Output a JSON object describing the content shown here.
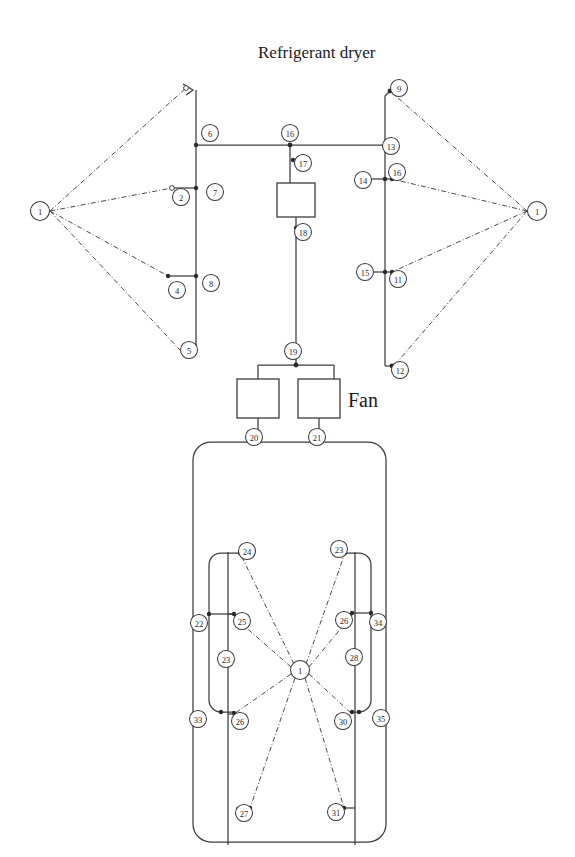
{
  "page": {
    "width": 575,
    "height": 857,
    "background": "#ffffff",
    "stroke_color": "#3c3c3c",
    "node_fill": "#ffffff"
  },
  "labels": {
    "title": "Refrigerant dryer",
    "fan": "Fan"
  },
  "diagram": {
    "type": "node-link-schematic",
    "node_count": 39,
    "box_count": 3
  },
  "nodes": [
    {
      "id": "n1_left",
      "label": "1",
      "cx": 40,
      "cy": 211,
      "r": 9.5
    },
    {
      "id": "n6",
      "label": "6",
      "cx": 210,
      "cy": 133,
      "r": 8.5
    },
    {
      "id": "n2",
      "label": "2",
      "cx": 181,
      "cy": 197,
      "r": 8.5
    },
    {
      "id": "n7",
      "label": "7",
      "cx": 215,
      "cy": 192,
      "r": 8.5
    },
    {
      "id": "n4",
      "label": "4",
      "cx": 177,
      "cy": 290,
      "r": 8.5
    },
    {
      "id": "n8",
      "label": "8",
      "cx": 211,
      "cy": 283,
      "r": 8.5
    },
    {
      "id": "n5",
      "label": "5",
      "cx": 189,
      "cy": 350,
      "r": 8.5
    },
    {
      "id": "n1_right",
      "label": "1",
      "cx": 537,
      "cy": 211,
      "r": 9.5
    },
    {
      "id": "n9",
      "label": "9",
      "cx": 399,
      "cy": 88,
      "r": 8.5
    },
    {
      "id": "n13",
      "label": "13",
      "cx": 391,
      "cy": 146,
      "r": 8.5
    },
    {
      "id": "n16",
      "label": "16",
      "cx": 397,
      "cy": 172,
      "r": 8.5
    },
    {
      "id": "n14",
      "label": "14",
      "cx": 363,
      "cy": 180,
      "r": 8.5
    },
    {
      "id": "n15",
      "label": "15",
      "cx": 365,
      "cy": 272,
      "r": 8.5
    },
    {
      "id": "n11",
      "label": "11",
      "cx": 398,
      "cy": 279,
      "r": 8.5
    },
    {
      "id": "n12",
      "label": "12",
      "cx": 400,
      "cy": 370,
      "r": 8.5
    },
    {
      "id": "n16c",
      "label": "16",
      "cx": 290,
      "cy": 133,
      "r": 8.5
    },
    {
      "id": "n17",
      "label": "17",
      "cx": 303,
      "cy": 163,
      "r": 8.5
    },
    {
      "id": "n18",
      "label": "18",
      "cx": 303,
      "cy": 232,
      "r": 8.5
    },
    {
      "id": "n19",
      "label": "19",
      "cx": 293,
      "cy": 351,
      "r": 8.5
    },
    {
      "id": "n20",
      "label": "20",
      "cx": 254,
      "cy": 437,
      "r": 8.5
    },
    {
      "id": "n21",
      "label": "21",
      "cx": 317,
      "cy": 437,
      "r": 8.5
    },
    {
      "id": "n1_hub",
      "label": "1",
      "cx": 300,
      "cy": 670,
      "r": 9.5
    },
    {
      "id": "n24",
      "label": "24",
      "cx": 247,
      "cy": 551,
      "r": 8.5
    },
    {
      "id": "n23t",
      "label": "23",
      "cx": 339,
      "cy": 549,
      "r": 8.5
    },
    {
      "id": "n22",
      "label": "22",
      "cx": 199,
      "cy": 623,
      "r": 8.5
    },
    {
      "id": "n25",
      "label": "25",
      "cx": 242,
      "cy": 621,
      "r": 8.5
    },
    {
      "id": "n26t",
      "label": "26",
      "cx": 344,
      "cy": 620,
      "r": 8.5
    },
    {
      "id": "n34",
      "label": "34",
      "cx": 378,
      "cy": 622,
      "r": 8.5
    },
    {
      "id": "n23",
      "label": "23",
      "cx": 226,
      "cy": 659,
      "r": 8.5
    },
    {
      "id": "n28",
      "label": "28",
      "cx": 354,
      "cy": 657,
      "r": 8.5
    },
    {
      "id": "n33",
      "label": "33",
      "cx": 198,
      "cy": 719,
      "r": 8.5
    },
    {
      "id": "n26",
      "label": "26",
      "cx": 240,
      "cy": 721,
      "r": 8.5
    },
    {
      "id": "n30",
      "label": "30",
      "cx": 343,
      "cy": 721,
      "r": 8.5
    },
    {
      "id": "n35",
      "label": "35",
      "cx": 381,
      "cy": 718,
      "r": 8.5
    },
    {
      "id": "n27",
      "label": "27",
      "cx": 244,
      "cy": 813,
      "r": 8.5
    },
    {
      "id": "n31",
      "label": "31",
      "cx": 336,
      "cy": 812,
      "r": 8.5
    }
  ],
  "boxes": [
    {
      "id": "box_dryer",
      "x": 277,
      "y": 183,
      "w": 38,
      "h": 34
    },
    {
      "id": "box_fan_left",
      "x": 237,
      "y": 379,
      "w": 42,
      "h": 39
    },
    {
      "id": "box_fan_right",
      "x": 298,
      "y": 379,
      "w": 42,
      "h": 39
    }
  ],
  "text_positions": {
    "title": {
      "x": 258,
      "y": 58
    },
    "fan": {
      "x": 348,
      "y": 407
    }
  }
}
